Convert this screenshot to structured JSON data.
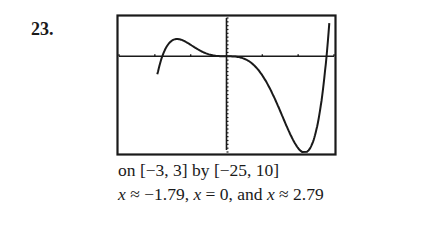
{
  "problem": {
    "number": "23."
  },
  "caption": {
    "window": "on [−3, 3] by [−25, 10]",
    "zeros_parts": [
      "x",
      " ≈ −1.79, ",
      "x",
      " = 0, and ",
      "x",
      " ≈ 2.79"
    ]
  },
  "chart_data": {
    "type": "line",
    "title": "",
    "xlabel": "",
    "ylabel": "",
    "xlim": [
      -3,
      3
    ],
    "ylim": [
      -25,
      10
    ],
    "grid": false,
    "axes_ticks": {
      "x_step": 1,
      "y_step": 1
    },
    "function": "x^5 - x^4 - 5x^3",
    "zeros": [
      -1.79,
      0,
      2.79
    ],
    "x": [
      -1.95,
      -1.9,
      -1.79,
      -1.6,
      -1.4,
      -1.3,
      -1.2,
      -1.0,
      -0.8,
      -0.5,
      -0.2,
      0,
      0.3,
      0.6,
      1.0,
      1.4,
      1.8,
      2.0,
      2.2,
      2.4,
      2.6,
      2.79,
      2.9,
      3.0
    ],
    "y": [
      -6.6,
      -4.3,
      0,
      3.8,
      4.3,
      4.4,
      4.1,
      3.0,
      1.6,
      0.5,
      0.04,
      0,
      -0.13,
      -0.97,
      -5.0,
      -11.3,
      -19.2,
      -24.0,
      -22.3,
      -17.7,
      -12.7,
      0,
      6.0,
      10.0
    ],
    "stroke_color": "#1a1a1a"
  }
}
